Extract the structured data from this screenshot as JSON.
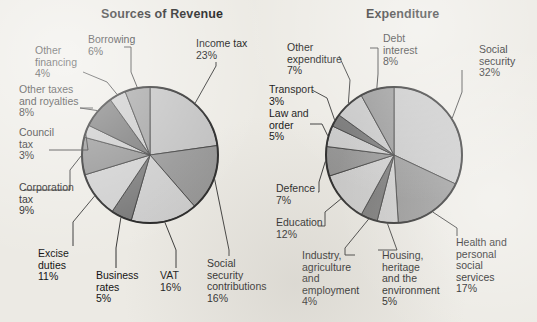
{
  "page": {
    "background_color": "#eceae4",
    "text_color": "#141414"
  },
  "charts": {
    "left": {
      "title": "Sources of Revenue",
      "center": [
        150,
        155
      ],
      "radius": 68
    },
    "right": {
      "title": "Expenditure",
      "center": [
        394,
        155
      ],
      "radius": 68
    }
  },
  "chart_data": [
    {
      "type": "pie",
      "title": "Sources of Revenue",
      "xlabel": "",
      "ylabel": "",
      "units": "percent",
      "legend_position": "leader-labels",
      "categories": [
        "Income tax",
        "Social security contributions",
        "VAT",
        "Business rates",
        "Excise duties",
        "Corporation tax",
        "Council tax",
        "Other taxes and royalties",
        "Other financing",
        "Borrowing"
      ],
      "values": [
        23,
        16,
        16,
        5,
        11,
        9,
        3,
        8,
        4,
        6
      ],
      "slice_colors": [
        "#bdbdbd",
        "#8e8e8e",
        "#c9c9c9",
        "#707070",
        "#cccccc",
        "#8b8b8b",
        "#c6c6c6",
        "#6e6e6e",
        "#c7c7c7",
        "#9a9a9a"
      ],
      "labels": [
        {
          "name": "income-tax",
          "text": "Income tax\n23%"
        },
        {
          "name": "social-security",
          "text": "Social\nsecurity\ncontributions\n16%"
        },
        {
          "name": "vat",
          "text": "VAT\n16%"
        },
        {
          "name": "business-rates",
          "text": "Business\nrates\n5%"
        },
        {
          "name": "excise-duties",
          "text": "Excise\nduties\n11%"
        },
        {
          "name": "corporation-tax",
          "text": "Corporation\ntax\n9%"
        },
        {
          "name": "council-tax",
          "text": "Council\ntax\n3%"
        },
        {
          "name": "other-taxes",
          "text": "Other taxes\nand royalties\n8%"
        },
        {
          "name": "other-financing",
          "text": "Other\nfinancing\n4%"
        },
        {
          "name": "borrowing",
          "text": "Borrowing\n6%"
        }
      ]
    },
    {
      "type": "pie",
      "title": "Expenditure",
      "xlabel": "",
      "ylabel": "",
      "units": "percent",
      "legend_position": "leader-labels",
      "categories": [
        "Social security",
        "Health and personal social services",
        "Housing, heritage and the environment",
        "Industry, agriculture and employment",
        "Education",
        "Defence",
        "Law and order",
        "Transport",
        "Other expenditure",
        "Debt interest"
      ],
      "values": [
        32,
        17,
        5,
        4,
        12,
        7,
        5,
        3,
        7,
        8
      ],
      "slice_colors": [
        "#c2c2c2",
        "#8e8e8e",
        "#cacaca",
        "#6e6e6e",
        "#c9c9c9",
        "#8b8b8b",
        "#c6c6c6",
        "#6c6c6c",
        "#c3c3c3",
        "#8f8f8f"
      ],
      "labels": [
        {
          "name": "social-security",
          "text": "Social\nsecurity\n32%"
        },
        {
          "name": "health",
          "text": "Health and\npersonal\nsocial\nservices\n17%"
        },
        {
          "name": "housing",
          "text": "Housing,\nheritage\nand the\nenvironment\n5%"
        },
        {
          "name": "industry",
          "text": "Industry,\nagriculture\nand\nemployment\n4%"
        },
        {
          "name": "education",
          "text": "Education\n12%"
        },
        {
          "name": "defence",
          "text": "Defence\n7%"
        },
        {
          "name": "law-and-order",
          "text": "Law and\norder\n5%"
        },
        {
          "name": "transport",
          "text": "Transport\n3%"
        },
        {
          "name": "other-expenditure",
          "text": "Other\nexpenditure\n7%"
        },
        {
          "name": "debt-interest",
          "text": "Debt\ninterest\n8%"
        }
      ]
    }
  ]
}
